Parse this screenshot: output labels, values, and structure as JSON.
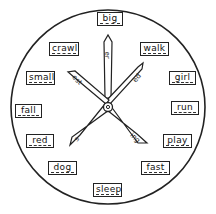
{
  "wheel": {
    "words": [
      {
        "id": "big",
        "label": "big",
        "x": 97,
        "y": 12,
        "w": 26
      },
      {
        "id": "walk",
        "label": "walk",
        "x": 140,
        "y": 42,
        "w": 29
      },
      {
        "id": "girl",
        "label": "girl",
        "x": 169,
        "y": 71,
        "w": 27
      },
      {
        "id": "run",
        "label": "run",
        "x": 171,
        "y": 101,
        "w": 28
      },
      {
        "id": "play",
        "label": "play",
        "x": 163,
        "y": 134,
        "w": 29
      },
      {
        "id": "fast",
        "label": "fast",
        "x": 141,
        "y": 161,
        "w": 29
      },
      {
        "id": "sleep",
        "label": "sleep",
        "x": 93,
        "y": 183,
        "w": 29
      },
      {
        "id": "dog",
        "label": "dog",
        "x": 48,
        "y": 161,
        "w": 29
      },
      {
        "id": "red",
        "label": "red",
        "x": 26,
        "y": 134,
        "w": 28
      },
      {
        "id": "fall",
        "label": "fall",
        "x": 15,
        "y": 104,
        "w": 27
      },
      {
        "id": "small",
        "label": "small",
        "x": 26,
        "y": 71,
        "w": 29
      },
      {
        "id": "crawl",
        "label": "crawl",
        "x": 49,
        "y": 42,
        "w": 30
      }
    ],
    "suffixes": {
      "up": "er",
      "upper_right": "ed",
      "upper_left": "est",
      "lower_left": "s",
      "lower_right": "ing"
    },
    "colors": {
      "ink": "#222222",
      "paper": "#ffffff"
    }
  }
}
